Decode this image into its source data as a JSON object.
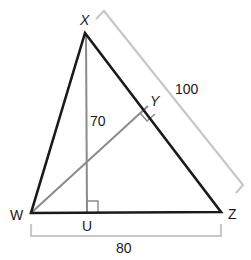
{
  "diagram": {
    "type": "triangle-with-altitudes",
    "colors": {
      "triangle": "#1a1a1a",
      "altitude": "#8a8a8a",
      "bracket": "#c8c8c8",
      "text": "#1a1a1a"
    },
    "vertices": {
      "X": {
        "label": "X",
        "x": 85,
        "y": 33
      },
      "W": {
        "label": "W",
        "x": 31,
        "y": 213
      },
      "Z": {
        "label": "Z",
        "x": 221,
        "y": 212
      },
      "U": {
        "label": "U",
        "x": 88,
        "y": 213
      },
      "Y": {
        "label": "Y",
        "x": 148,
        "y": 105
      }
    },
    "measurements": {
      "XZ": "100",
      "XU": "70",
      "WZ": "80"
    },
    "segments": [
      {
        "name": "XW",
        "role": "side"
      },
      {
        "name": "XZ",
        "role": "side"
      },
      {
        "name": "WZ",
        "role": "side"
      },
      {
        "name": "XU",
        "role": "altitude"
      },
      {
        "name": "WY",
        "role": "altitude"
      }
    ],
    "right_angles": [
      "U",
      "Y"
    ]
  }
}
